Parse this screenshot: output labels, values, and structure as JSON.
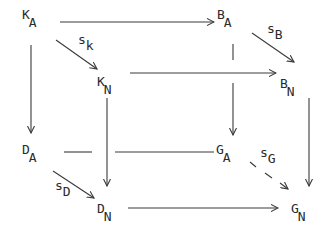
{
  "diagram": {
    "type": "commutative-cube",
    "nodes": [
      {
        "id": "KA",
        "main": "K",
        "sub": "A",
        "x": 22,
        "y": 18
      },
      {
        "id": "BA",
        "main": "B",
        "sub": "A",
        "x": 218,
        "y": 18
      },
      {
        "id": "KN",
        "main": "K",
        "sub": "N",
        "x": 97,
        "y": 78
      },
      {
        "id": "BN",
        "main": "B",
        "sub": "N",
        "x": 280,
        "y": 78
      },
      {
        "id": "DA",
        "main": "D",
        "sub": "A",
        "x": 22,
        "y": 143
      },
      {
        "id": "GA",
        "main": "G",
        "sub": "A",
        "x": 218,
        "y": 143
      },
      {
        "id": "DN",
        "main": "D",
        "sub": "N",
        "x": 97,
        "y": 203
      },
      {
        "id": "GN",
        "main": "G",
        "sub": "N",
        "x": 290,
        "y": 203
      }
    ],
    "edge_labels": [
      {
        "id": "sk",
        "main": "s",
        "sub": "k",
        "x": 78,
        "y": 38
      },
      {
        "id": "sB",
        "main": "s",
        "sub": "B",
        "x": 268,
        "y": 27
      },
      {
        "id": "sD",
        "main": "s",
        "sub": "D",
        "x": 55,
        "y": 185
      },
      {
        "id": "sG",
        "main": "s",
        "sub": "G",
        "x": 259,
        "y": 147
      }
    ],
    "edges": [
      {
        "from": "KA",
        "to": "BA",
        "label": ""
      },
      {
        "from": "KA",
        "to": "KN",
        "label": "sk"
      },
      {
        "from": "BA",
        "to": "BN",
        "label": "sB"
      },
      {
        "from": "KN",
        "to": "BN",
        "label": ""
      },
      {
        "from": "KA",
        "to": "DA",
        "label": ""
      },
      {
        "from": "BA",
        "to": "GA",
        "label": ""
      },
      {
        "from": "KN",
        "to": "DN",
        "label": ""
      },
      {
        "from": "BN",
        "to": "GN",
        "label": ""
      },
      {
        "from": "DA",
        "to": "GA",
        "label": "",
        "style": "hidden-behind"
      },
      {
        "from": "DA",
        "to": "DN",
        "label": "sD"
      },
      {
        "from": "GA",
        "to": "GN",
        "label": "sG",
        "style": "dashed"
      },
      {
        "from": "DN",
        "to": "GN",
        "label": ""
      }
    ],
    "stroke_color": "#3a3a3a"
  }
}
